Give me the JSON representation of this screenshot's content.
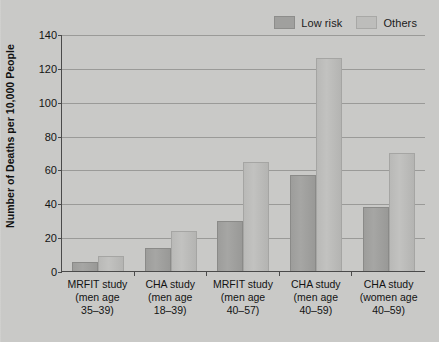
{
  "chart_data": {
    "type": "bar",
    "title": "",
    "xlabel": "",
    "ylabel": "Number of Deaths per 10,000 People",
    "ylim": [
      0,
      140
    ],
    "ytick_step": 20,
    "yticks": [
      "140",
      "120",
      "100",
      "80",
      "60",
      "40",
      "20",
      "0"
    ],
    "grid": "horizontal",
    "legend_position": "top-right",
    "categories": [
      "MRFIT study (men age 35–39)",
      "CHA study (men age 18–39)",
      "MRFIT study (men age 40–57)",
      "CHA study (men age 40–59)",
      "CHA study (women age 40–59)"
    ],
    "category_lines": [
      [
        "MRFIT study",
        "(men age",
        "35–39)"
      ],
      [
        "CHA study",
        "(men age",
        "18–39)"
      ],
      [
        "MRFIT study",
        "(men age",
        "40–57)"
      ],
      [
        "CHA study",
        "(men age",
        "40–59)"
      ],
      [
        "CHA study",
        "(women age",
        "40–59)"
      ]
    ],
    "series": [
      {
        "name": "Low risk",
        "color": "#a0a09e",
        "values": [
          5,
          13,
          29,
          56,
          37
        ]
      },
      {
        "name": "Others",
        "color": "#bdbdbb",
        "values": [
          8,
          23,
          64,
          125,
          69
        ]
      }
    ]
  },
  "legend": {
    "items": [
      {
        "label": "Low risk",
        "color": "#a0a09e"
      },
      {
        "label": "Others",
        "color": "#bdbdbb"
      }
    ]
  },
  "colors": {
    "background": "#cdcdcb",
    "axis": "#4a4a4a",
    "gridline": "#9a9a98",
    "low_risk": "#a0a09e",
    "others": "#bdbdbb",
    "text": "#141414"
  }
}
